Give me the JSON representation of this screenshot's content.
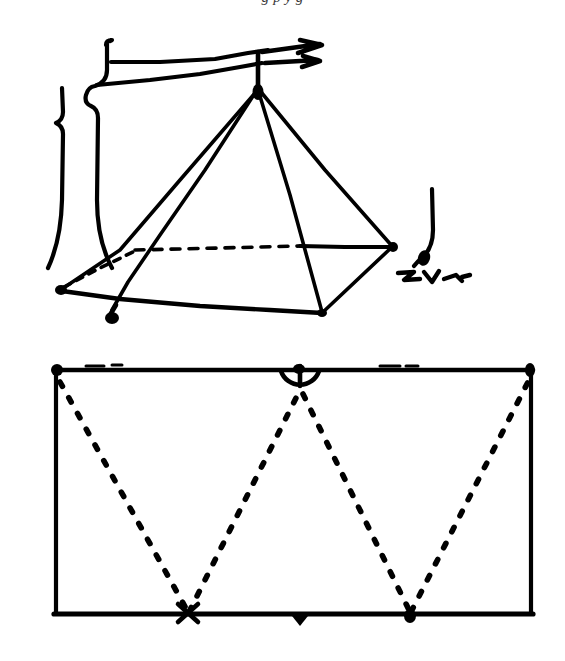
{
  "page": {
    "width": 565,
    "height": 661,
    "background_color": "#ffffff",
    "ink_color": "#000000",
    "kind": "scanned-handdrawn-figure"
  },
  "cut_text": {
    "visible_fragment": "g p y g",
    "note": "only descender strokes of a text line are visible at the very top edge"
  },
  "figures": [
    {
      "id": "pyramid-sketch",
      "name": "hand-drawn-pyramid",
      "caption_text": "",
      "elements": [
        {
          "name": "apex-vertex",
          "x": 258,
          "y": 88
        },
        {
          "name": "base-left-vertex",
          "x": 60,
          "y": 290
        },
        {
          "name": "base-right-vertex",
          "x": 393,
          "y": 247
        },
        {
          "name": "base-front-vertex",
          "x": 322,
          "y": 313
        },
        {
          "name": "base-back-vertex",
          "x": 129,
          "y": 253
        },
        {
          "name": "hidden-edge-style",
          "value": "dashed"
        },
        {
          "name": "visible-edge-style",
          "value": "solid"
        },
        {
          "name": "left-brace-marks",
          "count": 2
        },
        {
          "name": "right-annotation-scribble",
          "count": 1
        },
        {
          "name": "apex-arrow-annotation",
          "count": 1
        }
      ]
    },
    {
      "id": "reflection-diagram",
      "name": "rectangle-ray-reflection",
      "rect": {
        "left": 53,
        "top": 370,
        "right": 533,
        "bottom": 614
      },
      "ray": {
        "style": "dotted",
        "points": [
          {
            "name": "start-top-left",
            "x": 60,
            "y": 382
          },
          {
            "name": "bounce-bottom-1",
            "x": 188,
            "y": 614
          },
          {
            "name": "peak-top-middle",
            "x": 300,
            "y": 392
          },
          {
            "name": "bounce-bottom-2",
            "x": 410,
            "y": 614
          },
          {
            "name": "end-top-right",
            "x": 529,
            "y": 378
          }
        ]
      },
      "markers": [
        {
          "name": "corner-dot-top-left",
          "x": 57,
          "y": 371,
          "shape": "filled-circle"
        },
        {
          "name": "corner-dot-top-right",
          "x": 530,
          "y": 371,
          "shape": "filled-circle"
        },
        {
          "name": "arc-marker-top-middle",
          "x": 300,
          "y": 372,
          "shape": "semicircle-arc"
        },
        {
          "name": "cross-mark-bottom-1",
          "x": 188,
          "y": 614,
          "shape": "x-cross"
        },
        {
          "name": "dot-mark-bottom-2",
          "x": 410,
          "y": 614,
          "shape": "filled-circle"
        },
        {
          "name": "tick-mark-bottom-middle",
          "x": 300,
          "y": 618,
          "shape": "small-triangle"
        }
      ]
    }
  ]
}
